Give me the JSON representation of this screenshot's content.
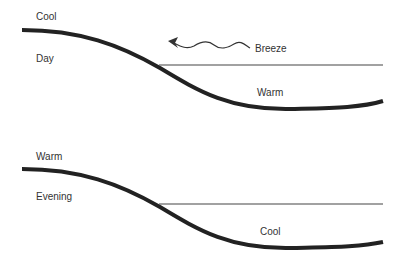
{
  "panels": [
    {
      "name": "day",
      "top_label": "Cool",
      "side_label": "Day",
      "water_label": "Warm",
      "breeze_label": "Breeze"
    },
    {
      "name": "evening",
      "top_label": "Warm",
      "side_label": "Evening",
      "water_label": "Cool"
    }
  ],
  "colors": {
    "curve": "#222222",
    "line": "#444444",
    "text": "#333333"
  }
}
